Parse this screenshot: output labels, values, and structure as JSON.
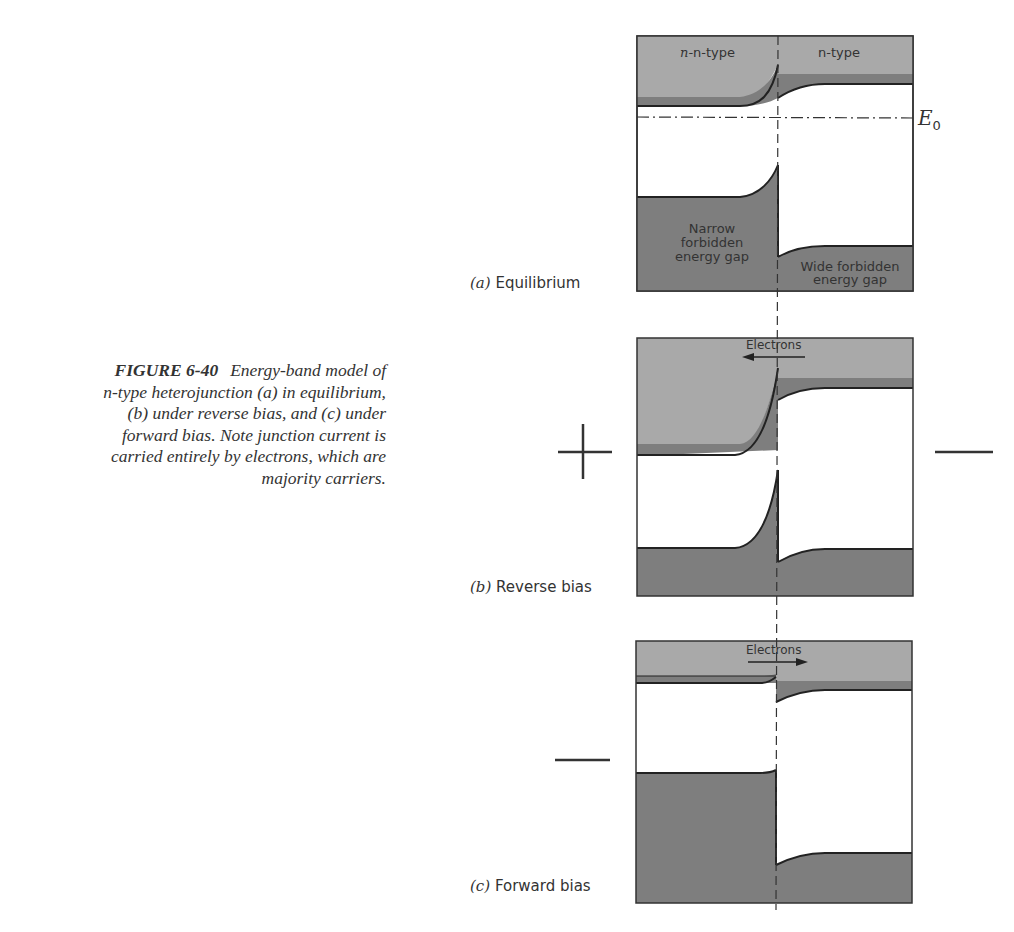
{
  "figure": {
    "number": "FIGURE 6-40",
    "caption_lines": [
      "Energy-band model of",
      "n-type heterojunction (a) in equilibrium,",
      "(b) under reverse bias, and (c) under",
      "forward bias.  Note junction current is",
      "carried entirely by electrons, which are",
      "majority carriers."
    ]
  },
  "panels": {
    "a": {
      "letter": "(a)",
      "title": "Equilibrium",
      "left_region_label": "n-type",
      "right_region_label": "n-type",
      "fermi_label": "E",
      "fermi_subscript": "0",
      "left_gap_label_lines": [
        "Narrow",
        "forbidden",
        "energy gap"
      ],
      "right_gap_label_lines": [
        "Wide forbidden",
        "energy gap"
      ]
    },
    "b": {
      "letter": "(b)",
      "title": "Reverse bias",
      "arrow_label": "Electrons",
      "arrow_direction": "left",
      "left_sign": "+",
      "right_sign": "—"
    },
    "c": {
      "letter": "(c)",
      "title": "Forward bias",
      "arrow_label": "Electrons",
      "arrow_direction": "right",
      "left_sign": "—"
    }
  },
  "colors": {
    "light_band": "#a9a9a9",
    "dark_band": "#7e7e7e",
    "outline": "#333333"
  }
}
